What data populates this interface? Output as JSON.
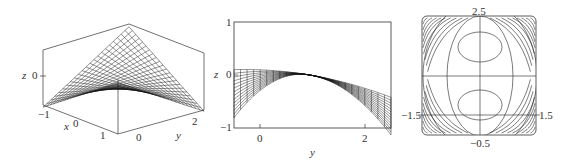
{
  "panels": {
    "surface3d": {
      "labels": {
        "z_axis": "z",
        "z_tick_0": "0",
        "x_axis": "x",
        "x_ticks": [
          "-1",
          "0",
          "1"
        ],
        "y_axis": "y",
        "y_ticks": [
          "0",
          "2"
        ]
      },
      "box": {
        "left_top": [
          43,
          50
        ],
        "left_bottom": [
          43,
          105
        ],
        "back_top": [
          129,
          24
        ],
        "right_top": [
          204,
          53
        ],
        "right_bottom": [
          204,
          110
        ],
        "front_bottom": [
          118,
          134
        ],
        "front_top": [
          118,
          80
        ]
      }
    },
    "projection_yz": {
      "labels": {
        "z_axis": "z",
        "z_ticks": [
          "1",
          "0",
          "-1"
        ],
        "y_axis": "y",
        "y_ticks": [
          "0",
          "2"
        ]
      },
      "frame": {
        "x0": 234,
        "y0": 22,
        "x1": 391,
        "y1": 128
      },
      "y_range": [
        -0.4,
        2.5
      ],
      "z_range": [
        -1,
        1
      ]
    },
    "contour": {
      "labels": {
        "top": "2.5",
        "bottom": "-0.5",
        "left": "-1.5",
        "right": "1.5"
      },
      "frame": {
        "x0": 422,
        "y0": 16,
        "x1": 536,
        "y1": 135
      }
    }
  },
  "colors": {
    "line": "#222222",
    "frame": "#333333",
    "background": "#ffffff"
  }
}
